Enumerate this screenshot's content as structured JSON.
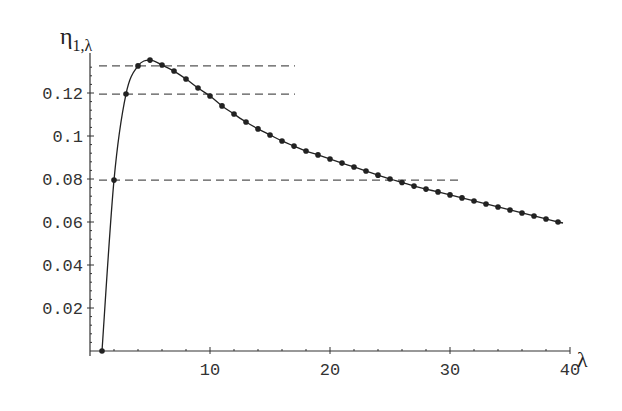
{
  "chart_data": {
    "type": "line",
    "title": "",
    "ylabel": "η_{1,λ}",
    "ylabel_main": "η",
    "ylabel_sub": "1,λ",
    "xlabel": "λ",
    "xlim": [
      0,
      40
    ],
    "ylim": [
      0,
      0.135
    ],
    "grid": false,
    "legend": null,
    "x_ticks": [
      10,
      20,
      30,
      40
    ],
    "x_tick_labels": [
      "10",
      "20",
      "30",
      "40"
    ],
    "y_ticks": [
      0.02,
      0.04,
      0.06,
      0.08,
      0.1,
      0.12
    ],
    "y_tick_labels": [
      "0.02",
      "0.04",
      "0.06",
      "0.08",
      "0.1",
      "0.12"
    ],
    "series": [
      {
        "name": "eta_1_lambda",
        "markers": true,
        "x": [
          1,
          2,
          3,
          4,
          5,
          6,
          7,
          8,
          9,
          10,
          11,
          12,
          13,
          14,
          15,
          16,
          17,
          18,
          19,
          20,
          21,
          22,
          23,
          24,
          25,
          26,
          27,
          28,
          29,
          30,
          31,
          32,
          33,
          34,
          35,
          36,
          37,
          38,
          39
        ],
        "values": [
          0.0,
          0.0795,
          0.1195,
          0.1326,
          0.1353,
          0.133,
          0.1302,
          0.1265,
          0.1223,
          0.1186,
          0.114,
          0.1102,
          0.1065,
          0.1033,
          0.1005,
          0.0977,
          0.0953,
          0.093,
          0.0912,
          0.0893,
          0.0874,
          0.0856,
          0.0837,
          0.0818,
          0.08,
          0.0784,
          0.0767,
          0.0753,
          0.074,
          0.0726,
          0.0712,
          0.0698,
          0.0684,
          0.067,
          0.0656,
          0.0642,
          0.0628,
          0.0614,
          0.06
        ]
      }
    ],
    "annotations": [
      {
        "type": "hline",
        "y": 0.1326,
        "x_start": 1,
        "x_end": 17,
        "style": "dashed"
      },
      {
        "type": "hline",
        "y": 0.1195,
        "x_start": 1,
        "x_end": 17,
        "style": "dashed"
      },
      {
        "type": "hline",
        "y": 0.0795,
        "x_start": 1,
        "x_end": 31,
        "style": "dashed"
      }
    ]
  }
}
